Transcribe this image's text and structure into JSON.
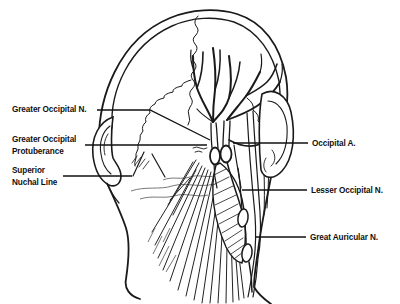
{
  "figure": {
    "background": "#ffffff",
    "ink_color": "#1a1a1a",
    "type": "anatomical line diagram, posterior view of head and neck",
    "labels": {
      "greater_occipital_n": "Greater Occipital N.",
      "greater_occipital_protuberance_1": "Greater Occipital",
      "greater_occipital_protuberance_2": "Protuberance",
      "superior_nuchal_line_1": "Superior",
      "superior_nuchal_line_2": "Nuchal Line",
      "occipital_a": "Occipital A.",
      "lesser_occipital_n": "Lesser Occipital N.",
      "great_auricular_n": "Great Auricular N."
    }
  }
}
